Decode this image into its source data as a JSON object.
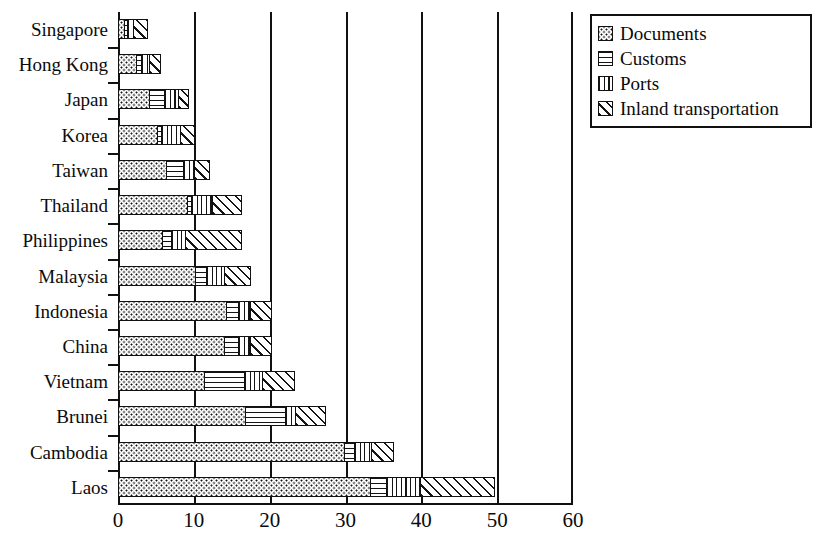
{
  "chart_data": {
    "type": "bar",
    "orientation": "horizontal",
    "stacked": true,
    "title": "",
    "xlabel": "",
    "ylabel": "",
    "xlim": [
      0,
      60
    ],
    "xticks": [
      0,
      10,
      20,
      30,
      40,
      50,
      60
    ],
    "xtick_labels": [
      "0",
      "10",
      "20",
      "30",
      "40",
      "50",
      "60"
    ],
    "grid": true,
    "legend_position": "top-right",
    "categories": [
      "Singapore",
      "Hong Kong",
      "Japan",
      "Korea",
      "Taiwan",
      "Thailand",
      "Philippines",
      "Malaysia",
      "Indonesia",
      "China",
      "Vietnam",
      "Brunei",
      "Cambodia",
      "Laos"
    ],
    "series": [
      {
        "name": "Documents",
        "pattern": "dots",
        "values": [
          1.0,
          2.6,
          4.3,
          5.4,
          6.5,
          9.3,
          6.0,
          10.3,
          14.5,
          14.2,
          11.5,
          17.0,
          30.0,
          33.4
        ]
      },
      {
        "name": "Customs",
        "pattern": "horizontal-lines",
        "values": [
          1.6,
          3.4,
          6.5,
          6.1,
          9.0,
          10.0,
          7.4,
          12.0,
          16.3,
          16.3,
          17.0,
          22.5,
          31.5,
          35.8
        ]
      },
      {
        "name": "Ports",
        "pattern": "vertical-lines",
        "values": [
          2.6,
          4.7,
          8.5,
          8.8,
          10.6,
          13.0,
          9.5,
          14.6,
          18.0,
          18.0,
          19.6,
          24.0,
          34.0,
          40.4
        ]
      },
      {
        "name": "Inland transportation",
        "pattern": "diagonal-hatch",
        "values": [
          4.6,
          6.3,
          10.0,
          10.8,
          12.8,
          17.0,
          17.0,
          18.2,
          21.0,
          21.0,
          24.0,
          28.0,
          37.0,
          50.3
        ]
      }
    ],
    "cumulative_note": "series values are cumulative right-edge positions of each stacked segment"
  },
  "legend": {
    "items": [
      {
        "label": "Documents",
        "pattern": "dots"
      },
      {
        "label": "Customs",
        "pattern": "horizontal-lines"
      },
      {
        "label": "Ports",
        "pattern": "vertical-lines"
      },
      {
        "label": "Inland transportation",
        "pattern": "diagonal-hatch"
      }
    ]
  },
  "colors": {
    "ink": "#111111",
    "background": "#ffffff"
  }
}
